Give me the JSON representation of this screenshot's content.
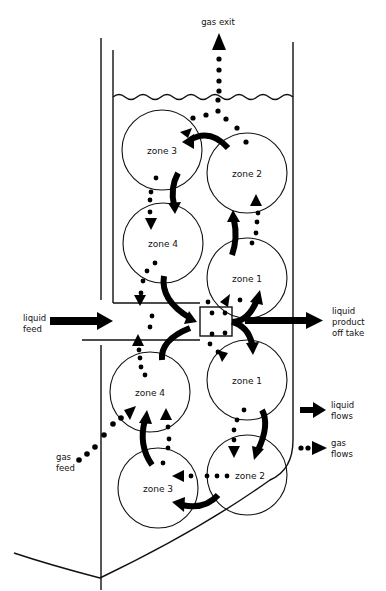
{
  "colors": {
    "ink": "#111111",
    "background": "#ffffff"
  },
  "labels": {
    "gas_exit": "gas exit",
    "liquid_feed": [
      "liquid",
      "feed"
    ],
    "liquid_product": [
      "liquid",
      "product",
      "off take"
    ],
    "gas_feed": [
      "gas",
      "feed"
    ]
  },
  "legend": {
    "liquid_flows": [
      "liquid",
      "flows"
    ],
    "gas_flows": [
      "gas",
      "flows"
    ]
  },
  "zones": {
    "upper": [
      {
        "id": "upper-zone-3",
        "label": "zone 3"
      },
      {
        "id": "upper-zone-2",
        "label": "zone 2"
      },
      {
        "id": "upper-zone-4",
        "label": "zone 4"
      },
      {
        "id": "upper-zone-1",
        "label": "zone 1"
      }
    ],
    "lower": [
      {
        "id": "lower-zone-4",
        "label": "zone 4"
      },
      {
        "id": "lower-zone-1",
        "label": "zone 1"
      },
      {
        "id": "lower-zone-3",
        "label": "zone 3"
      },
      {
        "id": "lower-zone-2",
        "label": "zone 2"
      }
    ]
  }
}
